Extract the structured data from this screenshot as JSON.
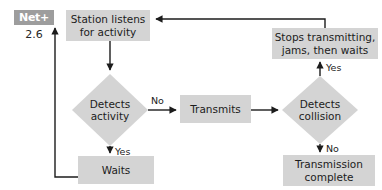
{
  "figure": {
    "type": "flowchart",
    "background_color": "#ffffff",
    "node_fill_color": "#d4d4d4",
    "line_color": "#1c1c1c",
    "text_color": "#1c1c1c"
  },
  "badge": {
    "name": "Net+",
    "label": "Net+",
    "version": "2.6",
    "fill_color": "#9d9d9d",
    "text_color": "#ffffff"
  },
  "nodes": [
    {
      "id": "station-listens",
      "shape": "rect",
      "line1": "Station listens",
      "line2": "for activity"
    },
    {
      "id": "detects-activity",
      "shape": "diamond",
      "line1": "Detects",
      "line2": "activity"
    },
    {
      "id": "waits",
      "shape": "rect",
      "line1": "Waits",
      "line2": ""
    },
    {
      "id": "transmits",
      "shape": "rect",
      "line1": "Transmits",
      "line2": ""
    },
    {
      "id": "detects-collision",
      "shape": "diamond",
      "line1": "Detects",
      "line2": "collision"
    },
    {
      "id": "stops-transmitting",
      "shape": "rect",
      "line1": "Stops transmitting,",
      "line2": "jams, then waits"
    },
    {
      "id": "transmission-complete",
      "shape": "rect",
      "line1": "Transmission",
      "line2": "complete"
    }
  ],
  "edge_labels": [
    {
      "id": "activity-no",
      "text": "No"
    },
    {
      "id": "activity-yes",
      "text": "Yes"
    },
    {
      "id": "collision-yes",
      "text": "Yes"
    },
    {
      "id": "collision-no",
      "text": "No"
    }
  ]
}
